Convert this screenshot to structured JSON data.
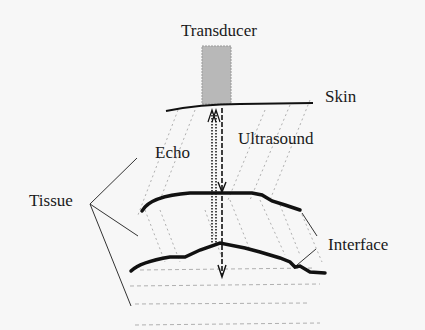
{
  "diagram": {
    "type": "ultrasound-echo-schematic",
    "labels": {
      "transducer": "Transducer",
      "skin": "Skin",
      "ultrasound": "Ultrasound",
      "echo": "Echo",
      "tissue": "Tissue",
      "interface": "Interface"
    },
    "colors": {
      "background": "#f7f7f7",
      "transducer_fill": "#b8b8b8",
      "line": "#111111",
      "dotted": "#aaaaaa"
    }
  }
}
